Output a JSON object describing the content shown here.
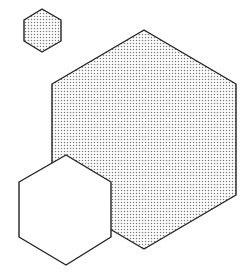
{
  "canvas": {
    "width": 252,
    "height": 277,
    "background": "#ffffff"
  },
  "style": {
    "stroke_color": "#222222",
    "stroke_width": 1.4,
    "dot_color": "#7a7a7a",
    "dot_spacing": 3,
    "dot_radius": 0.75,
    "plain_fill": "#ffffff"
  },
  "shapes": [
    {
      "id": "small-dotted-hexagon",
      "type": "hexagon",
      "fill": "dotted",
      "points": "42,9 61,20 61,41 42,52 24,41 24,20"
    },
    {
      "id": "large-dotted-hexagon",
      "type": "hexagon",
      "fill": "dotted",
      "points": "144,30 236,84 236,195 144,249 52,195 52,84"
    },
    {
      "id": "white-hexagon",
      "type": "hexagon",
      "fill": "plain",
      "points": "66,155 111,182 111,237 66,265 19,237 19,182"
    }
  ]
}
